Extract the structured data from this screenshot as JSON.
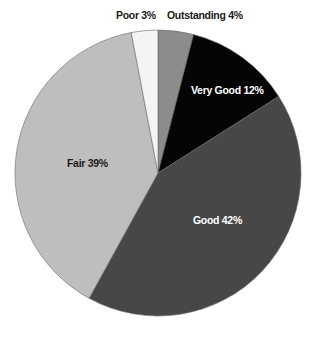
{
  "chart_data": {
    "type": "pie",
    "title": "",
    "start_angle": "12 o'clock",
    "direction": "clockwise",
    "categories": [
      "Outstanding",
      "Very Good",
      "Good",
      "Fair",
      "Poor"
    ],
    "values": [
      4,
      12,
      42,
      39,
      3
    ],
    "unit": "%",
    "slices": [
      {
        "name": "Outstanding",
        "value": 4,
        "label": "Outstanding 4%",
        "color": "#8c8c8c",
        "label_color": "#1a1a1a",
        "label_pos": "outside"
      },
      {
        "name": "Very Good",
        "value": 12,
        "label": "Very Good 12%",
        "color": "#050505",
        "label_color": "#ffffff",
        "label_pos": "inside"
      },
      {
        "name": "Good",
        "value": 42,
        "label": "Good 42%",
        "color": "#474747",
        "label_color": "#ffffff",
        "label_pos": "inside"
      },
      {
        "name": "Fair",
        "value": 39,
        "label": "Fair 39%",
        "color": "#bebebe",
        "label_color": "#1a1a1a",
        "label_pos": "inside"
      },
      {
        "name": "Poor",
        "value": 3,
        "label": "Poor 3%",
        "color": "#f4f4f4",
        "label_color": "#1a1a1a",
        "label_pos": "outside"
      }
    ],
    "legend": "none",
    "grid": false
  }
}
